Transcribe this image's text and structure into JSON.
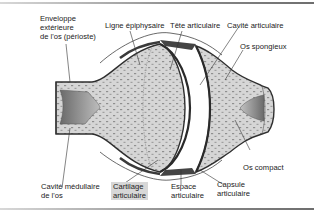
{
  "diagram": {
    "colors": {
      "bone_fill": "#d4d4d4",
      "outline": "#333333",
      "cartilage": "#3c3c3c",
      "highlight": "#d7d7d7",
      "rule": "#7a7a7a"
    },
    "labels": {
      "enveloppe": {
        "line1": "Enveloppe",
        "line2": "extérieure",
        "line3": "de l'os (périoste)"
      },
      "ligne_epiphysaire": "Ligne épiphysaire",
      "tete_articulaire": "Tête articulaire",
      "cavite_articulaire": "Cavité articulaire",
      "os_spongieux": "Os spongieux",
      "os_compact": "Os compact",
      "cavite_medullaire": {
        "line1": "Cavité médullaire",
        "line2": "de l'os"
      },
      "cartilage_articulaire": {
        "line1": "Cartilage",
        "line2": "articulaire"
      },
      "espace_articulaire": {
        "line1": "Espace",
        "line2": "articulaire"
      },
      "capsule_articulaire": {
        "line1": "Capsule",
        "line2": "articulaire"
      }
    }
  }
}
